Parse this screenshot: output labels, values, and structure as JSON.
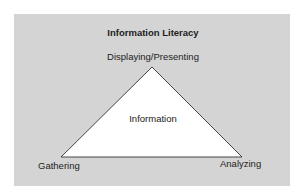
{
  "diagram": {
    "title": "Information Literacy",
    "center_label": "Information",
    "vertices": {
      "top": "Displaying/Presenting",
      "bottom_left": "Gathering",
      "bottom_right": "Analyzing"
    },
    "colors": {
      "panel": "#d4d4d4",
      "triangle_fill": "#ffffff",
      "triangle_stroke": "#333333",
      "text": "#222222"
    }
  }
}
